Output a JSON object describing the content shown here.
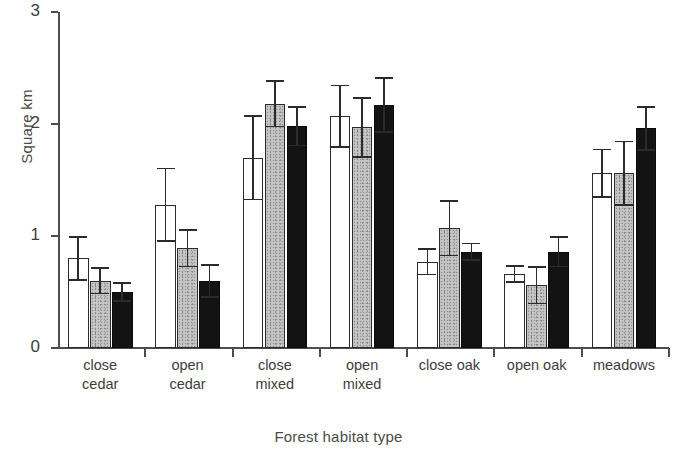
{
  "chart_data": {
    "type": "bar",
    "title": "",
    "subtitle": "",
    "xlabel": "Forest habitat type",
    "ylabel": "Square km",
    "ylim": [
      0,
      3
    ],
    "yticks": [
      0,
      1,
      2,
      3
    ],
    "ytick_labels": [
      "0",
      "1",
      "2",
      "3"
    ],
    "grid": false,
    "legend": "none",
    "orientation": "vertical",
    "error_bars": "symmetric",
    "categories": [
      "close cedar",
      "open cedar",
      "close mixed",
      "open mixed",
      "close oak",
      "open oak",
      "meadows"
    ],
    "category_lines": [
      [
        "close",
        "cedar"
      ],
      [
        "open",
        "cedar"
      ],
      [
        "close",
        "mixed"
      ],
      [
        "open",
        "mixed"
      ],
      [
        "close oak"
      ],
      [
        "open oak"
      ],
      [
        "meadows"
      ]
    ],
    "series": [
      {
        "name": "series-1",
        "fill": "white",
        "color": "#ffffff",
        "edge_color": "#2b2b2b",
        "values": [
          0.8,
          1.28,
          1.7,
          2.07,
          0.77,
          0.66,
          1.56
        ],
        "errors": [
          0.2,
          0.33,
          0.38,
          0.28,
          0.12,
          0.08,
          0.22
        ]
      },
      {
        "name": "series-2",
        "fill": "stippled-gray",
        "color": "#bdbdbd",
        "edge_color": "#2b2b2b",
        "values": [
          0.6,
          0.89,
          2.18,
          1.97,
          1.07,
          0.56,
          1.56
        ],
        "errors": [
          0.12,
          0.17,
          0.21,
          0.27,
          0.25,
          0.17,
          0.29
        ]
      },
      {
        "name": "series-3",
        "fill": "black",
        "color": "#131313",
        "edge_color": "#0a0a0a",
        "values": [
          0.5,
          0.6,
          1.98,
          2.17,
          0.86,
          0.86,
          1.96
        ],
        "errors": [
          0.09,
          0.15,
          0.18,
          0.25,
          0.08,
          0.14,
          0.2
        ]
      }
    ]
  }
}
